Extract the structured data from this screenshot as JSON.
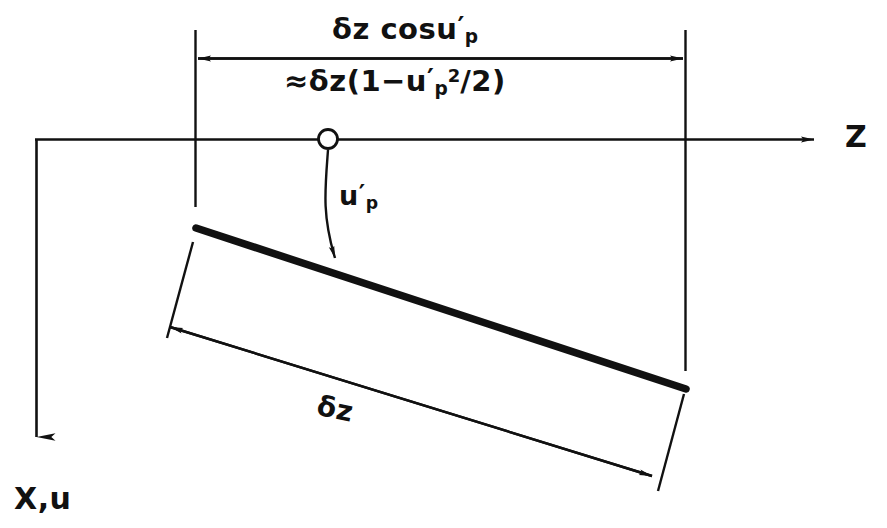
{
  "figure": {
    "background_color": "#ffffff",
    "ink_color": "#111111",
    "width": 887,
    "height": 528
  },
  "axes": {
    "horizontal": {
      "name": "Z",
      "label": "Z",
      "direction": "right",
      "arrow": true
    },
    "vertical": {
      "name": "X,u",
      "label": "X,u",
      "direction": "down",
      "arrow": true
    }
  },
  "labels": {
    "projected_length": {
      "text": "δz cosu′ₚ",
      "parts": {
        "delta_z": "δz",
        "cos": "cosu",
        "prime": "′",
        "subscript": "p"
      }
    },
    "projected_length_approx": {
      "text": "≈δz(1−u′ₚ²/2)",
      "parts": {
        "approx": "≈",
        "delta_z": "δz",
        "open": "(1−",
        "u": "u",
        "prime": "′",
        "subscript": "p",
        "power": "2",
        "close": "/2)"
      }
    },
    "rotation_angle": {
      "text": "u′ₚ",
      "parts": {
        "u": "u",
        "prime": "′",
        "subscript": "p"
      }
    },
    "element_length": {
      "text": "δz",
      "parts": {
        "delta_z": "δz"
      }
    },
    "z_axis": "Z",
    "xu_axis": "X,u"
  },
  "elements": {
    "node_marker": "open-circle-node",
    "beam": "inclined-beam-element",
    "angle_arc": "rotation-angle-arc",
    "top_dimension": "projected-length-dimension",
    "bottom_dimension": "element-length-dimension"
  },
  "geometry": {
    "node": {
      "cx": 328,
      "cy": 139,
      "r": 10
    },
    "z_axis_line": {
      "x1": 35,
      "y1": 139,
      "x2": 828,
      "y2": 139
    },
    "xu_axis_line": {
      "x1": 36,
      "y1": 139,
      "x2": 36,
      "y2": 455
    },
    "beam_line": {
      "x1": 196,
      "y1": 228,
      "x2": 686,
      "y2": 389
    },
    "top_dim_line": {
      "x1": 196,
      "y1": 58,
      "x2": 685,
      "y2": 58
    },
    "bottom_dim_line": {
      "x1": 166,
      "y1": 326,
      "x2": 656,
      "y2": 477
    },
    "extension_left_top": {
      "x1": 195,
      "y1": 30,
      "x2": 195,
      "y2": 207
    },
    "extension_right_top": {
      "x1": 685,
      "y1": 30,
      "x2": 685,
      "y2": 371
    },
    "extension_left_bottom": {
      "x1": 193,
      "y1": 243,
      "x2": 167,
      "y2": 338
    },
    "extension_right_bottom": {
      "x1": 684,
      "y1": 395,
      "x2": 657,
      "y2": 490
    }
  }
}
